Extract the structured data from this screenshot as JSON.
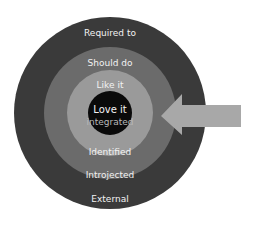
{
  "diagram": {
    "type": "concentric-circles",
    "center": {
      "x": 110,
      "y": 113
    },
    "rings": [
      {
        "name": "external",
        "radius": 96,
        "color": "#3a3a3a",
        "top_label": "Required to",
        "bottom_label": "External"
      },
      {
        "name": "introjected",
        "radius": 66,
        "color": "#6b6b6b",
        "top_label": "Should do",
        "bottom_label": "Introjected"
      },
      {
        "name": "identified",
        "radius": 43,
        "color": "#9a9a9a",
        "top_label": "Like it",
        "bottom_label": "Identified"
      },
      {
        "name": "integrated",
        "radius": 22,
        "color": "#0a0a0a",
        "top_label": "Love it",
        "bottom_label": "integrated"
      }
    ],
    "arrow": {
      "direction": "left",
      "color": "#a8a8a8"
    }
  },
  "labels": {
    "required_to": "Required to",
    "should_do": "Should do",
    "like_it": "Like it",
    "love_it": "Love it",
    "integrated": "integrated",
    "identified": "Identified",
    "introjected": "Introjected",
    "external": "External"
  }
}
